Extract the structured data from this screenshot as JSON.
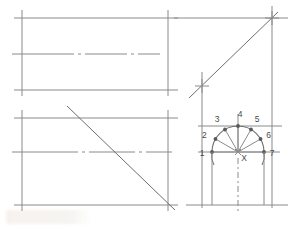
{
  "drawing": {
    "title": "Orthographic projection with seven-division semicircle",
    "colors": {
      "line": "#8a8a8a",
      "line_dark": "#6e6e6e",
      "arc": "#707070",
      "point": "#5a5a5a",
      "text": "#4a4a4a",
      "background": "#ffffff"
    },
    "views": {
      "top_left": {
        "name": "top-view-rectangle",
        "x": 22,
        "y": 18,
        "width": 146,
        "height": 72,
        "centerline_y": 54,
        "overshoot": 10
      },
      "bottom_left": {
        "name": "front-view-rectangle",
        "x": 22,
        "y": 118,
        "width": 146,
        "height": 87,
        "centerline_y": 152,
        "overshoot": 10,
        "diagonal": {
          "x1": 67,
          "y1": 106,
          "x2": 175,
          "y2": 210
        }
      },
      "top_right": {
        "name": "side-view-diagonal",
        "diagonal": {
          "x1": 189,
          "y1": 98,
          "x2": 278,
          "y2": 12
        },
        "horizontal_y": 18,
        "horizontal_x1": 174,
        "horizontal_x2": 288,
        "vertical_x": 272,
        "vertical_y1": 12,
        "vertical_y2": 208,
        "left_vertical_x": 202,
        "left_vertical_y1": 72,
        "left_vertical_y2": 208
      },
      "bottom_right": {
        "name": "semicircle-construction",
        "center_x": 238,
        "center_y": 152,
        "radius": 26,
        "baseline_y": 205,
        "baseline_x1": 186,
        "baseline_x2": 288,
        "upper_rule_y": 126,
        "upper_rule_x1": 198,
        "upper_rule_x2": 282,
        "diameter_x1": 204,
        "diameter_x2": 272,
        "center_mark_label": "X"
      }
    },
    "semicircle_points": [
      {
        "label": "1",
        "angle_deg": 180,
        "label_dx": -10,
        "label_dy": 4
      },
      {
        "label": "2",
        "angle_deg": 150,
        "label_dx": -11,
        "label_dy": -1
      },
      {
        "label": "3",
        "angle_deg": 120,
        "label_dx": -8,
        "label_dy": -7
      },
      {
        "label": "4",
        "angle_deg": 90,
        "label_dx": 2,
        "label_dy": -9
      },
      {
        "label": "5",
        "angle_deg": 60,
        "label_dx": 6,
        "label_dy": -7
      },
      {
        "label": "6",
        "angle_deg": 30,
        "label_dx": 8,
        "label_dy": -1
      },
      {
        "label": "7",
        "angle_deg": 0,
        "label_dx": 8,
        "label_dy": 4
      }
    ],
    "tick_crosses": [
      {
        "name": "cross-upper-right",
        "x": 272,
        "y": 18,
        "size": 7
      },
      {
        "name": "cross-mid-left",
        "x": 202,
        "y": 86,
        "size": 7
      }
    ]
  }
}
